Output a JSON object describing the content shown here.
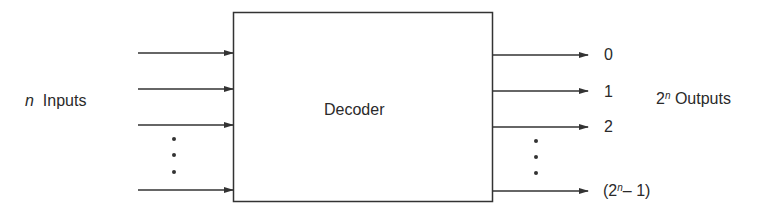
{
  "block": {
    "label": "Decoder"
  },
  "inputs": {
    "label_var": "n",
    "label_text": "Inputs",
    "arrow_count_shown": 4,
    "ellipsis": "⋮"
  },
  "outputs": {
    "label_base": "2",
    "label_exp": "n",
    "label_text": "Outputs",
    "items": [
      {
        "label": "0"
      },
      {
        "label": "1"
      },
      {
        "label": "2"
      },
      {
        "label_prefix": "(2",
        "label_exp": "n",
        "label_suffix": "– 1)"
      }
    ]
  },
  "colors": {
    "stroke": "#333333",
    "text": "#2a2a2a",
    "background": "#ffffff"
  }
}
